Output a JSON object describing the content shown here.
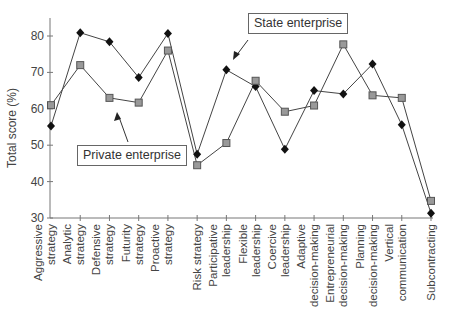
{
  "chart_data": {
    "type": "line",
    "title": "",
    "xlabel": "",
    "ylabel": "Total score (%)",
    "ylim": [
      30,
      85
    ],
    "yticks": [
      30,
      40,
      50,
      60,
      70,
      80
    ],
    "grid": false,
    "categories": [
      [
        "Aggressive",
        "strategy"
      ],
      [
        "Analytic",
        "strategy"
      ],
      [
        "Defensive",
        "strategy"
      ],
      [
        "Futurity",
        "strategy"
      ],
      [
        "Proactive",
        "strategy"
      ],
      [
        "Risk strategy"
      ],
      [
        "Participative",
        "leadership"
      ],
      [
        "Flexible",
        "leadership"
      ],
      [
        "Coercive",
        "leadership"
      ],
      [
        "Adaptive",
        "decision-making"
      ],
      [
        "Entrepreneurial",
        "decision-making"
      ],
      [
        "Planning",
        "decision-making"
      ],
      [
        "Vertical",
        "communication"
      ],
      [
        "Subcontracting"
      ]
    ],
    "series": [
      {
        "name": "State enterprise",
        "marker": "diamond",
        "color": "#111111",
        "values": [
          55.3,
          80.9,
          78.4,
          68.6,
          80.7,
          47.5,
          70.7,
          66.1,
          48.9,
          65.0,
          64.1,
          72.3,
          55.6,
          31.3
        ]
      },
      {
        "name": "Private enterprise",
        "marker": "square",
        "color": "#999999",
        "values": [
          61.0,
          72.0,
          63.0,
          61.7,
          76.0,
          44.5,
          50.6,
          67.7,
          59.2,
          60.9,
          77.7,
          63.7,
          63.0,
          34.7
        ]
      }
    ],
    "annotations": [
      {
        "text": "State enterprise",
        "arrow_to_series": "State enterprise"
      },
      {
        "text": "Private enterprise",
        "arrow_to_series": "Private enterprise"
      }
    ]
  },
  "annotations": {
    "state": "State enterprise",
    "private": "Private enterprise"
  },
  "axis": {
    "ylabel": "Total score (%)"
  }
}
